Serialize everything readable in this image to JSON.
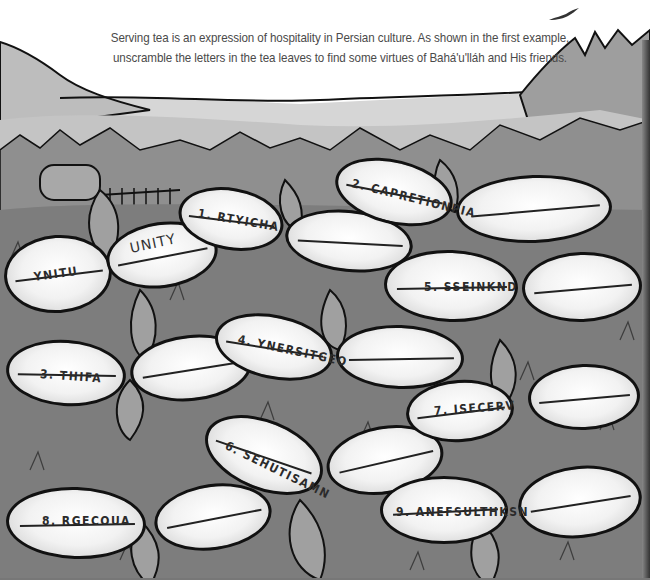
{
  "instructions": {
    "line1": "Serving tea is an expression of hospitality in Persian culture. As shown in the first example,",
    "line2": "unscramble the letters in the tea leaves to find some virtues of Bahá'u'lláh and His friends."
  },
  "example": {
    "scrambled": "YNITU",
    "answer": "UNITY"
  },
  "puzzles": [
    {
      "number": "1.",
      "scrambled": "RTYICHA"
    },
    {
      "number": "2.",
      "scrambled": "CAPRETIONPIA"
    },
    {
      "number": "3.",
      "scrambled": "THIFA"
    },
    {
      "number": "4.",
      "scrambled": "YNERSITGEO"
    },
    {
      "number": "5.",
      "scrambled": "SSEINKND"
    },
    {
      "number": "6.",
      "scrambled": "SEHUTISAMN"
    },
    {
      "number": "7.",
      "scrambled": "ISECERV"
    },
    {
      "number": "8.",
      "scrambled": "RGECOUA"
    },
    {
      "number": "9.",
      "scrambled": "ANEFSULTHKSN"
    }
  ],
  "labels": {
    "p1": "1. RTYICHA",
    "p2": "2. CAPRETIONPIA",
    "p3": "3. THIFA",
    "p4": "4. YNERSITGEO",
    "p5": "5. SSEINKND",
    "p6": "6. SEHUTISAMN",
    "p7": "7. ISECERV",
    "p8": "8. RGECOUA",
    "p9": "9. ANEFSULTHKSN"
  },
  "icons": {
    "bird": "bird-icon",
    "mountains": "mountain-landscape",
    "tea_plants": "tea-leaf"
  },
  "colors": {
    "ink": "#111111",
    "sky": "#ffffff",
    "text": "#4a4a4a",
    "leaf_fill": "#f2f2f2",
    "foliage": "#8a8a8a"
  }
}
